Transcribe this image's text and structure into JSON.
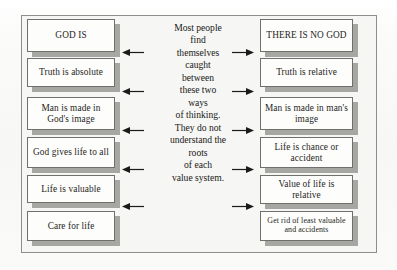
{
  "figure": {
    "frame_color": "#8d8d89",
    "box_fill": "#fdfdfc",
    "box_border": "#6f6f6b",
    "shadow_color": "#a6a6a2",
    "background": "#f6f6f4"
  },
  "left_column": {
    "heading": "GOD IS",
    "items": [
      {
        "text": "GOD IS"
      },
      {
        "text": "Truth is absolute"
      },
      {
        "text": "Man is made in God's image"
      },
      {
        "text": "God gives life to all"
      },
      {
        "text": "Life is valuable"
      },
      {
        "text": "Care for life"
      }
    ]
  },
  "right_column": {
    "heading": "THERE IS NO GOD",
    "items": [
      {
        "text": "THERE IS NO GOD"
      },
      {
        "text": "Truth is relative"
      },
      {
        "text": "Man is made in man's image"
      },
      {
        "text": "Life is chance or accident"
      },
      {
        "text": "Value of life is relative"
      },
      {
        "text": "Get rid of least valuable and accidents"
      }
    ]
  },
  "center": {
    "lines": [
      "Most people",
      "find",
      "themselves",
      "caught",
      "between",
      "these two",
      "ways",
      "of thinking.",
      "They do not",
      "understand the",
      "roots",
      "of each",
      "value system."
    ],
    "full_text": "Most people find themselves caught between these two ways of thinking. They do not understand the roots of each value system."
  },
  "arrows": {
    "left_direction": "left",
    "right_direction": "right",
    "left_count": 5,
    "right_count": 5,
    "color": "#1a1a18"
  }
}
